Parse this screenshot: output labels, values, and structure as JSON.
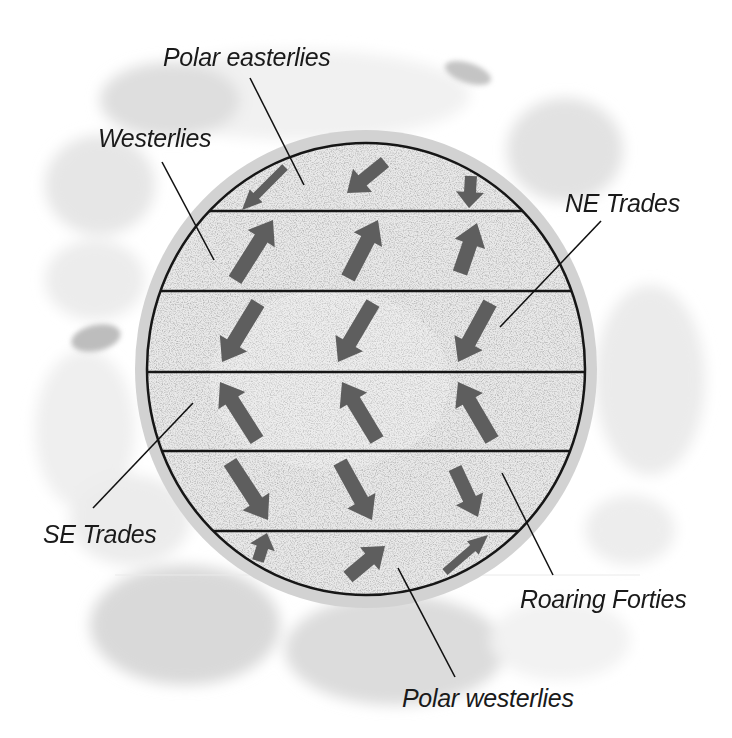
{
  "diagram": {
    "colors": {
      "arrow": "#5e5e5e",
      "globe_fill": "#e8e8e8",
      "globe_rim": "#cfcfcf",
      "outline": "#161616",
      "label_text": "#1a1a1a"
    },
    "labels": {
      "polar_easterlies": "Polar easterlies",
      "westerlies": "Westerlies",
      "ne_trades": "NE Trades",
      "se_trades": "SE Trades",
      "roaring_forties": "Roaring Forties",
      "polar_westerlies": "Polar westerlies"
    },
    "bands": [
      {
        "order": 1,
        "wind": "Polar easterlies",
        "direction": "south-west"
      },
      {
        "order": 2,
        "wind": "Westerlies",
        "direction": "north-east"
      },
      {
        "order": 3,
        "wind": "NE Trades",
        "direction": "south-west"
      },
      {
        "order": 4,
        "wind": "SE Trades",
        "direction": "north-west"
      },
      {
        "order": 5,
        "wind": "Roaring Forties",
        "direction": "south-east"
      },
      {
        "order": 6,
        "wind": "Polar westerlies",
        "direction": "north-east"
      }
    ],
    "arrows": [
      {
        "band": 1,
        "tail": [
          285,
          167
        ],
        "tip": [
          242,
          210
        ],
        "w": 8,
        "hw": 18,
        "hl": 20
      },
      {
        "band": 1,
        "tail": [
          385,
          162
        ],
        "tip": [
          347,
          193
        ],
        "w": 13,
        "hw": 30,
        "hl": 20
      },
      {
        "band": 1,
        "tail": [
          471,
          176
        ],
        "tip": [
          469,
          208
        ],
        "w": 12,
        "hw": 28,
        "hl": 16
      },
      {
        "band": 2,
        "tail": [
          235,
          280
        ],
        "tip": [
          273,
          220
        ],
        "w": 15,
        "hw": 32,
        "hl": 22
      },
      {
        "band": 2,
        "tail": [
          348,
          278
        ],
        "tip": [
          378,
          220
        ],
        "w": 15,
        "hw": 32,
        "hl": 22
      },
      {
        "band": 2,
        "tail": [
          460,
          273
        ],
        "tip": [
          477,
          223
        ],
        "w": 15,
        "hw": 32,
        "hl": 22
      },
      {
        "band": 3,
        "tail": [
          258,
          303
        ],
        "tip": [
          222,
          362
        ],
        "w": 15,
        "hw": 32,
        "hl": 22
      },
      {
        "band": 3,
        "tail": [
          373,
          303
        ],
        "tip": [
          338,
          362
        ],
        "w": 15,
        "hw": 32,
        "hl": 22
      },
      {
        "band": 3,
        "tail": [
          490,
          303
        ],
        "tip": [
          458,
          362
        ],
        "w": 15,
        "hw": 32,
        "hl": 22
      },
      {
        "band": 4,
        "tail": [
          257,
          440
        ],
        "tip": [
          220,
          382
        ],
        "w": 15,
        "hw": 32,
        "hl": 22
      },
      {
        "band": 4,
        "tail": [
          377,
          440
        ],
        "tip": [
          342,
          382
        ],
        "w": 15,
        "hw": 32,
        "hl": 22
      },
      {
        "band": 4,
        "tail": [
          492,
          440
        ],
        "tip": [
          458,
          382
        ],
        "w": 15,
        "hw": 32,
        "hl": 22
      },
      {
        "band": 5,
        "tail": [
          230,
          462
        ],
        "tip": [
          268,
          520
        ],
        "w": 15,
        "hw": 32,
        "hl": 22
      },
      {
        "band": 5,
        "tail": [
          340,
          462
        ],
        "tip": [
          372,
          520
        ],
        "w": 15,
        "hw": 32,
        "hl": 22
      },
      {
        "band": 5,
        "tail": [
          455,
          468
        ],
        "tip": [
          478,
          517
        ],
        "w": 14,
        "hw": 30,
        "hl": 20
      },
      {
        "band": 6,
        "tail": [
          258,
          561
        ],
        "tip": [
          267,
          533
        ],
        "w": 12,
        "hw": 26,
        "hl": 15
      },
      {
        "band": 6,
        "tail": [
          348,
          577
        ],
        "tip": [
          385,
          546
        ],
        "w": 14,
        "hw": 30,
        "hl": 20
      },
      {
        "band": 6,
        "tail": [
          445,
          572
        ],
        "tip": [
          488,
          535
        ],
        "w": 8,
        "hw": 18,
        "hl": 20
      }
    ]
  }
}
